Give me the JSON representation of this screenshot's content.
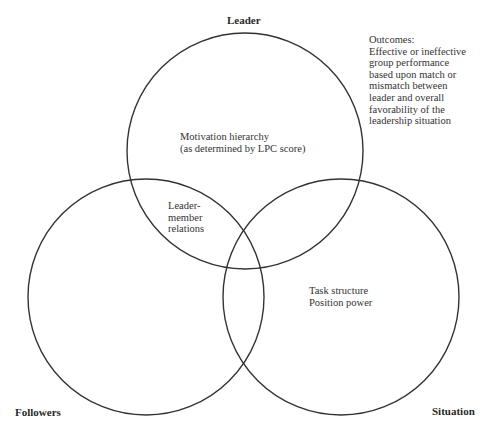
{
  "diagram": {
    "title": "",
    "circles": [
      {
        "id": "leader",
        "label": "Leader",
        "cx": 245,
        "cy": 151,
        "r": 118
      },
      {
        "id": "followers",
        "label": "Followers",
        "cx": 146,
        "cy": 297,
        "r": 118
      },
      {
        "id": "situation",
        "label": "Situation",
        "cx": 341,
        "cy": 297,
        "r": 118
      }
    ],
    "stroke_color": "#333333",
    "labels": {
      "leader": "Leader",
      "followers": "Followers",
      "situation": "Situation"
    },
    "outcomes": {
      "heading": "Outcomes:",
      "lines": [
        "Effective or ineffective",
        "group performance",
        "based upon match or",
        "mismatch between",
        "leader and overall",
        "favorability of the",
        "leadership situation"
      ]
    },
    "leader_region": {
      "lines": [
        "Motivation hierarchy",
        "(as determined by LPC score)"
      ]
    },
    "leader_followers_overlap": {
      "lines": [
        "Leader-",
        "member",
        "relations"
      ]
    },
    "situation_region": {
      "lines": [
        "Task structure",
        "Position power"
      ]
    }
  }
}
